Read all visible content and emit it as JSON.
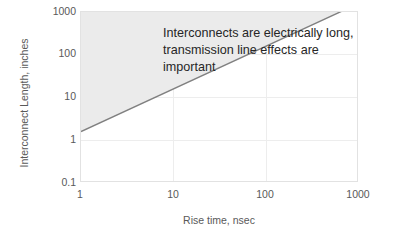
{
  "chart_data": {
    "type": "line",
    "title": "",
    "xlabel": "Rise time, nsec",
    "ylabel": "Interconnect Length, inches",
    "xscale": "log",
    "yscale": "log",
    "xlim": [
      1,
      1000
    ],
    "ylim": [
      0.1,
      1000
    ],
    "xticks": [
      "1",
      "10",
      "100",
      "1000"
    ],
    "xtick_values": [
      1,
      10,
      100,
      1000
    ],
    "yticks": [
      "1000",
      "100",
      "10",
      "1",
      "0.1"
    ],
    "ytick_values": [
      1000,
      100,
      10,
      1,
      0.1
    ],
    "grid": true,
    "legend": "none",
    "series": [
      {
        "name": "Electrically long boundary",
        "x": [
          1,
          10,
          100,
          1000
        ],
        "y": [
          1.6,
          16,
          160,
          1600
        ],
        "color": "#808080",
        "width": 1.4
      }
    ],
    "shaded_region": {
      "name": "electrically-long-region",
      "description": "Area above the boundary line",
      "color": "#ebebeb"
    },
    "annotations": [
      {
        "name": "electrically-long-note",
        "text": "Interconnects are electrically long, transmission line effects are important",
        "color": "#262626"
      }
    ]
  },
  "axes": {
    "x_title": "Rise time, nsec",
    "y_title": "Interconnect Length, inches",
    "x_labels": [
      "1",
      "10",
      "100",
      "1000"
    ],
    "y_labels": [
      "1000",
      "100",
      "10",
      "1",
      "0.1"
    ]
  },
  "annotation": {
    "text": "Interconnects are electrically long, transmission line effects are important"
  },
  "colors": {
    "line": "#808080",
    "shade": "#ebebeb",
    "grid": "#ededed",
    "border": "#e2e2e2",
    "tick_text": "#595959",
    "annotation_text": "#262626",
    "background": "#ffffff"
  }
}
